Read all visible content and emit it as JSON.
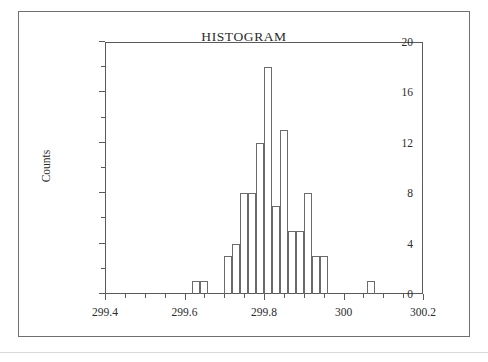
{
  "figure": {
    "title": "HISTOGRAM",
    "frame_color": "#6f6f6f",
    "axis_color": "#5a5a5a",
    "bar_edge_color": "#6b6b6b",
    "background": "#ffffff"
  },
  "axes": {
    "y_title": "Counts",
    "y_ticks": [
      "0",
      "4",
      "8",
      "12",
      "16",
      "20"
    ],
    "y_minor_ticks": [
      "2",
      "6",
      "10",
      "14",
      "18"
    ],
    "x_ticks": [
      "299.4",
      "299.6",
      "299.8",
      "300",
      "300.2"
    ],
    "x_minor_ticks": [
      "299.45",
      "299.5",
      "299.55",
      "299.65",
      "299.7",
      "299.75",
      "299.85",
      "299.9",
      "299.95",
      "300.05",
      "300.1",
      "300.15"
    ]
  },
  "chart_data": {
    "type": "bar",
    "title": "HISTOGRAM",
    "xlabel": "",
    "ylabel": "Counts",
    "xlim": [
      299.4,
      300.2
    ],
    "ylim": [
      0,
      20
    ],
    "grid": false,
    "legend": "none",
    "bin_width": 0.02,
    "bin_left_edges": [
      299.62,
      299.64,
      299.7,
      299.72,
      299.74,
      299.76,
      299.78,
      299.8,
      299.82,
      299.84,
      299.86,
      299.88,
      299.9,
      299.92,
      299.94,
      299.96,
      299.98,
      300.0,
      300.06
    ],
    "categories": [
      "299.62",
      "299.64",
      "299.70",
      "299.72",
      "299.74",
      "299.76",
      "299.78",
      "299.80",
      "299.82",
      "299.84",
      "299.86",
      "299.88",
      "299.90",
      "299.92",
      "299.94",
      "299.96",
      "299.98",
      "300.00",
      "300.06"
    ],
    "values": [
      1,
      1,
      3,
      4,
      8,
      8,
      12,
      18,
      7,
      13,
      5,
      5,
      8,
      3,
      3,
      0,
      0,
      0,
      1
    ],
    "bars": [
      {
        "left": 299.62,
        "right": 299.64,
        "count": 1
      },
      {
        "left": 299.64,
        "right": 299.66,
        "count": 1
      },
      {
        "left": 299.7,
        "right": 299.72,
        "count": 3
      },
      {
        "left": 299.72,
        "right": 299.74,
        "count": 4
      },
      {
        "left": 299.74,
        "right": 299.76,
        "count": 8
      },
      {
        "left": 299.76,
        "right": 299.78,
        "count": 8
      },
      {
        "left": 299.78,
        "right": 299.8,
        "count": 12
      },
      {
        "left": 299.8,
        "right": 299.82,
        "count": 18
      },
      {
        "left": 299.82,
        "right": 299.84,
        "count": 7
      },
      {
        "left": 299.84,
        "right": 299.86,
        "count": 13
      },
      {
        "left": 299.86,
        "right": 299.88,
        "count": 5
      },
      {
        "left": 299.88,
        "right": 299.9,
        "count": 5
      },
      {
        "left": 299.9,
        "right": 299.92,
        "count": 8
      },
      {
        "left": 299.92,
        "right": 299.94,
        "count": 3
      },
      {
        "left": 299.94,
        "right": 299.96,
        "count": 3
      },
      {
        "left": 300.06,
        "right": 300.08,
        "count": 1
      }
    ]
  }
}
